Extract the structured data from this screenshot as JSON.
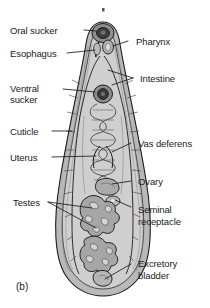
{
  "figure": {
    "panel_id": "(b)",
    "diagram_type": "labeled-anatomical-diagram",
    "colors": {
      "background": "#ffffff",
      "outline": "#1b1b1b",
      "cuticle_fill": "#b4b4b4",
      "parenchyma_fill": "#d2d2d2",
      "organ_fill": "#9a9a9a",
      "organ_dark": "#4a4a4a",
      "label_text": "#1b1b1b",
      "leader_line": "#1b1b1b"
    }
  },
  "labels": {
    "left": [
      {
        "id": "oral-sucker",
        "text": "Oral sucker",
        "lines": [
          "Oral sucker"
        ]
      },
      {
        "id": "esophagus",
        "text": "Esophagus",
        "lines": [
          "Esophagus"
        ]
      },
      {
        "id": "ventral-sucker",
        "text": "Ventral sucker",
        "lines": [
          "Ventral",
          "sucker"
        ]
      },
      {
        "id": "cuticle",
        "text": "Cuticle",
        "lines": [
          "Cuticle"
        ]
      },
      {
        "id": "uterus",
        "text": "Uterus",
        "lines": [
          "Uterus"
        ]
      },
      {
        "id": "testes",
        "text": "Testes",
        "lines": [
          "Testes"
        ]
      }
    ],
    "right": [
      {
        "id": "pharynx",
        "text": "Pharynx",
        "lines": [
          "Pharynx"
        ]
      },
      {
        "id": "intestine",
        "text": "Intestine",
        "lines": [
          "Intestine"
        ]
      },
      {
        "id": "vas-deferens",
        "text": "Vas deferens",
        "lines": [
          "Vas deferens"
        ]
      },
      {
        "id": "ovary",
        "text": "Ovary",
        "lines": [
          "Ovary"
        ]
      },
      {
        "id": "seminal-receptacle",
        "text": "Seminal receptacle",
        "lines": [
          "Seminal",
          "receptacle"
        ]
      },
      {
        "id": "excretory-bladder",
        "text": "Excretory bladder",
        "lines": [
          "Excretory",
          "bladder"
        ]
      }
    ]
  },
  "text": {
    "oral_sucker": "Oral sucker",
    "esophagus": "Esophagus",
    "ventral_1": "Ventral",
    "ventral_2": "sucker",
    "cuticle": "Cuticle",
    "uterus": "Uterus",
    "testes": "Testes",
    "pharynx": "Pharynx",
    "intestine": "Intestine",
    "vas_deferens": "Vas deferens",
    "ovary": "Ovary",
    "seminal_1": "Seminal",
    "seminal_2": "receptacle",
    "excretory_1": "Excretory",
    "excretory_2": "bladder",
    "panel_id": "(b)"
  }
}
